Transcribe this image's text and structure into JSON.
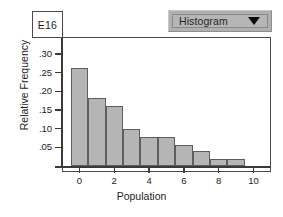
{
  "cell_reference": {
    "label": "E16"
  },
  "chart_type_selector": {
    "selected": "Histogram",
    "caret_icon": "chevron-down-icon",
    "options": [
      "Histogram"
    ],
    "background_color": "#b0b0b0"
  },
  "chart_data": {
    "type": "bar",
    "title": "",
    "subtitle": "",
    "xlabel": "Population",
    "ylabel": "Relative Frequency",
    "categories": [
      0,
      1,
      2,
      3,
      4,
      5,
      6,
      7,
      8,
      9
    ],
    "values": [
      0.262,
      0.181,
      0.161,
      0.1,
      0.078,
      0.078,
      0.057,
      0.04,
      0.02,
      0.02
    ],
    "series": [
      {
        "name": "Relative Frequency",
        "values": [
          0.262,
          0.181,
          0.161,
          0.1,
          0.078,
          0.078,
          0.057,
          0.04,
          0.02,
          0.02
        ]
      }
    ],
    "xlim": [
      -1,
      11
    ],
    "ylim": [
      0,
      0.335
    ],
    "x_ticks": [
      0,
      2,
      4,
      6,
      8,
      10
    ],
    "x_tick_labels": [
      "0",
      "2",
      "4",
      "6",
      "8",
      "10"
    ],
    "y_ticks": [
      0.05,
      0.1,
      0.15,
      0.2,
      0.25,
      0.3
    ],
    "y_tick_labels": [
      ".05",
      ".10",
      ".15",
      ".20",
      ".25",
      ".30"
    ],
    "grid": false,
    "legend": false,
    "legend_position": "none",
    "bar_fill_color": "#b5b5b5",
    "bar_edge_color": "#5e5e5e",
    "bar_width": 1,
    "axis_color": "#3a3a3a",
    "plot_background": "#ffffff"
  }
}
